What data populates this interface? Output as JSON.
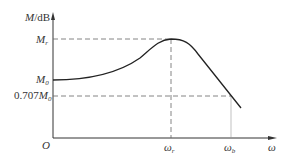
{
  "diagram": {
    "type": "closed-loop frequency response magnitude curve",
    "y_axis": {
      "label_var": "M",
      "label_unit": "/dB"
    },
    "x_axis": {
      "label": "ω"
    },
    "origin": "O",
    "levels": {
      "resonant_peak": {
        "main": "M",
        "sub": "r"
      },
      "zero_freq": {
        "main": "M",
        "sub": "0"
      },
      "bandwidth_level": {
        "prefix": "0.707",
        "main": "M",
        "sub": "0"
      }
    },
    "frequencies": {
      "resonant": {
        "main": "ω",
        "sub": "r"
      },
      "bandwidth": {
        "main": "ω",
        "sub": "b"
      }
    },
    "colors": {
      "line": "#222222",
      "dash": "#666666"
    }
  }
}
